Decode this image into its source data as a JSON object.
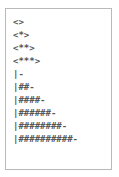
{
  "panel": {
    "border_color": "#b9b9b9",
    "background_color": "#ffffff",
    "text_color": "#575757"
  },
  "ascii_art": {
    "line_count": 10,
    "lines": [
      {
        "text": "<>"
      },
      {
        "text": "<*>"
      },
      {
        "text": "<**>"
      },
      {
        "text": "<***>"
      },
      {
        "text": "|-"
      },
      {
        "text": "|##-"
      },
      {
        "text": "|####-"
      },
      {
        "text": "|######-"
      },
      {
        "text": "|########-"
      },
      {
        "text": "|##########-"
      }
    ]
  }
}
